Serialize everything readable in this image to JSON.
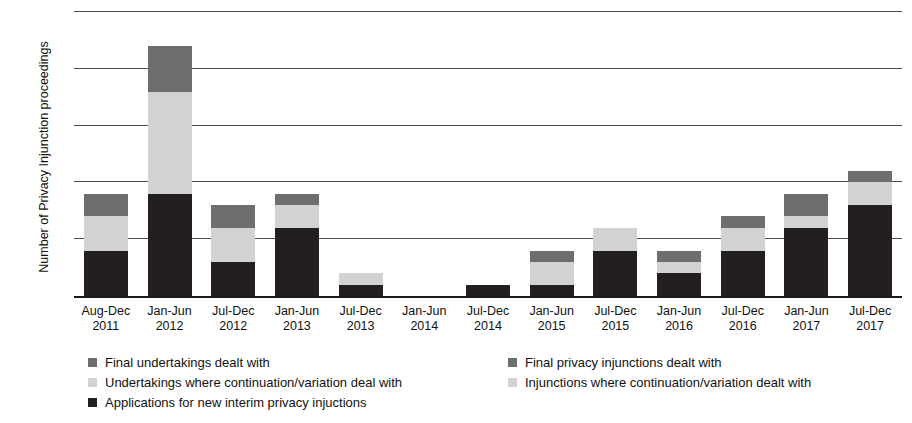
{
  "chart_data": {
    "type": "bar",
    "subtype": "stacked-vertical",
    "title": "",
    "xlabel": "",
    "ylabel": "Number of Privacy Injunction proceedings",
    "ylim": [
      0,
      25
    ],
    "yticks": [
      0,
      5,
      10,
      15,
      20,
      25
    ],
    "grid": true,
    "legend_position": "bottom",
    "categories": [
      "Aug-Dec 2011",
      "Jan-Jun 2012",
      "Jul-Dec 2012",
      "Jan-Jun 2013",
      "Jul-Dec 2013",
      "Jan-Jun 2014",
      "Jul-Dec 2014",
      "Jan-Jun 2015",
      "Jul-Dec 2015",
      "Jan-Jun 2016",
      "Jul-Dec 2016",
      "Jan-Jun 2017",
      "Jul-Dec 2017"
    ],
    "category_lines": [
      [
        "Aug-Dec",
        "2011"
      ],
      [
        "Jan-Jun",
        "2012"
      ],
      [
        "Jul-Dec",
        "2012"
      ],
      [
        "Jan-Jun",
        "2013"
      ],
      [
        "Jul-Dec",
        "2013"
      ],
      [
        "Jan-Jun",
        "2014"
      ],
      [
        "Jul-Dec",
        "2014"
      ],
      [
        "Jan-Jun",
        "2015"
      ],
      [
        "Jul-Dec",
        "2015"
      ],
      [
        "Jan-Jun",
        "2016"
      ],
      [
        "Jul-Dec",
        "2016"
      ],
      [
        "Jan-Jun",
        "2017"
      ],
      [
        "Jul-Dec",
        "2017"
      ]
    ],
    "series": [
      {
        "name": "Applications for new interim privacy injuctions",
        "color": "#231f20",
        "values": [
          4,
          9,
          3,
          6,
          1,
          0,
          1,
          1,
          4,
          2,
          4,
          6,
          8
        ]
      },
      {
        "name": "Injunctions where continuation/variation dealt with",
        "color": "#d2d2d2",
        "values": [
          3,
          9,
          3,
          2,
          1,
          0,
          0,
          2,
          2,
          1,
          2,
          1,
          2
        ]
      },
      {
        "name": "Final privacy injunctions dealt with",
        "color": "#6e6e6e",
        "values": [
          2,
          4,
          2,
          1,
          0,
          0,
          0,
          1,
          0,
          1,
          1,
          2,
          1
        ]
      }
    ],
    "totals": [
      9,
      22,
      8,
      9,
      2,
      0,
      1,
      4,
      6,
      4,
      7,
      9,
      11
    ]
  },
  "legend": {
    "items": [
      {
        "label": "Final undertakings dealt with",
        "swatch": "sw2",
        "column": "left",
        "row": 1
      },
      {
        "label": "Final privacy injunctions dealt with",
        "swatch": "sw2",
        "column": "right",
        "row": 1
      },
      {
        "label": "Undertakings where continuation/variation deal with",
        "swatch": "sw1",
        "column": "left",
        "row": 2
      },
      {
        "label": "Injunctions where continuation/variation dealt with",
        "swatch": "sw1",
        "column": "right",
        "row": 2
      },
      {
        "label": "Applications for new interim privacy injuctions",
        "swatch": "sw0",
        "column": "left",
        "row": 3
      }
    ]
  },
  "colors": {
    "series_dark": "#231f20",
    "series_light": "#d2d2d2",
    "series_mid": "#6e6e6e",
    "gridline": "#4c4c4c",
    "axis": "#1a1a1a",
    "background": "#ffffff"
  }
}
